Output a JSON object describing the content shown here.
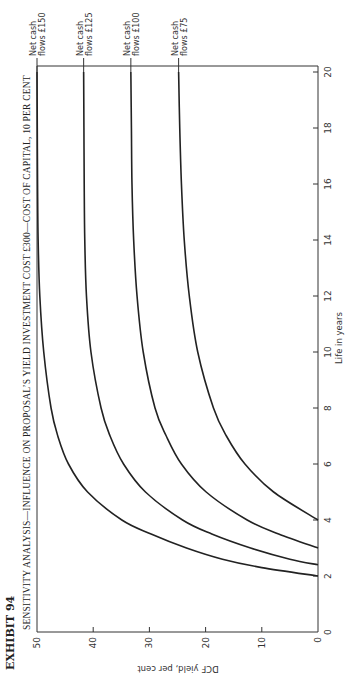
{
  "exhibit": "EXHIBIT 94",
  "chart_data": {
    "type": "line",
    "title": "SENSITIVITY ANALYSIS—INFLUENCE ON PROPOSAL’S YIELD INVESTMENT COST £300—COST OF CAPITAL, 10 PER CENT",
    "xlabel": "Life in years",
    "ylabel": "DCF yield, per cent",
    "xlim": [
      0,
      20
    ],
    "ylim": [
      0,
      50
    ],
    "xticks": [
      "0",
      "2",
      "4",
      "6",
      "8",
      "10",
      "12",
      "14",
      "16",
      "18",
      "20"
    ],
    "yticks": [
      "0",
      "10",
      "20",
      "30",
      "40",
      "50"
    ],
    "grid": false,
    "orientation": "rotated 90 degrees counter-clockwise",
    "series": [
      {
        "name": "Net cash flows £150",
        "label_line1": "Net cash",
        "label_line2": "flows £150",
        "x": [
          2,
          2.3,
          2.6,
          3,
          3.5,
          4,
          5,
          6,
          7,
          8,
          10,
          12,
          14,
          16,
          18,
          20
        ],
        "y": [
          0,
          10,
          17,
          23.4,
          29.7,
          34.9,
          41.0,
          44.4,
          46.3,
          47.5,
          48.8,
          49.5,
          49.8,
          49.9,
          49.95,
          50
        ]
      },
      {
        "name": "Net cash flows £125",
        "label_line1": "Net cash",
        "label_line2": "flows £125",
        "x": [
          2.4,
          2.6,
          3,
          3.5,
          4,
          5,
          6,
          7,
          8,
          10,
          12,
          14,
          16,
          18,
          20
        ],
        "y": [
          0,
          5,
          12.0,
          18.9,
          24.1,
          30.7,
          34.6,
          37.0,
          38.6,
          40.4,
          41.2,
          41.5,
          41.6,
          41.65,
          41.7
        ]
      },
      {
        "name": "Net cash flows £100",
        "label_line1": "Net cash",
        "label_line2": "flows £100",
        "x": [
          3,
          3.5,
          4,
          5,
          6,
          7,
          8,
          10,
          12,
          14,
          16,
          18,
          20
        ],
        "y": [
          0,
          7.0,
          12.6,
          19.9,
          24.3,
          27.0,
          29.0,
          31.1,
          32.2,
          32.8,
          33.1,
          33.2,
          33.3
        ]
      },
      {
        "name": "Net cash flows £75",
        "label_line1": "Net cash",
        "label_line2": "flows £75",
        "x": [
          4,
          5,
          6,
          7,
          8,
          10,
          12,
          14,
          16,
          18,
          20
        ],
        "y": [
          0,
          7.9,
          13.0,
          16.3,
          18.6,
          21.4,
          22.9,
          23.8,
          24.3,
          24.6,
          24.8
        ]
      }
    ]
  }
}
